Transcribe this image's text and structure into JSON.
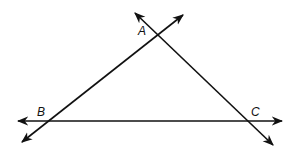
{
  "diagram": {
    "vertices": [
      {
        "label": "A",
        "x": 158,
        "y": 34,
        "label_x": 138,
        "label_y": 35
      },
      {
        "label": "B",
        "x": 48,
        "y": 121,
        "label_x": 37,
        "label_y": 116
      },
      {
        "label": "C",
        "x": 248,
        "y": 121,
        "label_x": 251,
        "label_y": 116
      }
    ],
    "lines": [
      {
        "name": "line-BC",
        "x1": 18,
        "y1": 121,
        "x2": 282,
        "y2": 121
      },
      {
        "name": "line-AB",
        "x1": 22,
        "y1": 142,
        "x2": 183,
        "y2": 15
      },
      {
        "name": "line-AC",
        "x1": 135,
        "y1": 13,
        "x2": 273,
        "y2": 145
      }
    ],
    "stroke_color": "#111111"
  }
}
